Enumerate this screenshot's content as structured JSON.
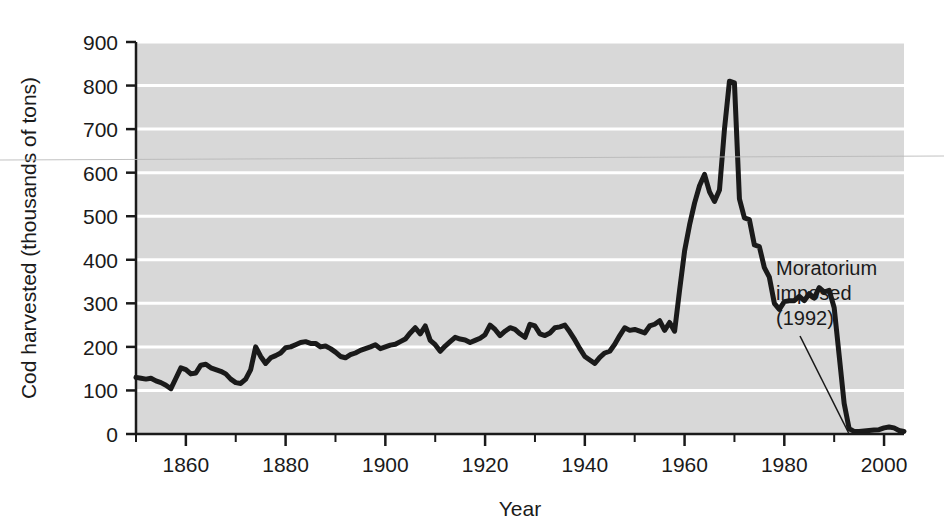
{
  "chart_data": {
    "type": "line",
    "title": "",
    "subtitle": "",
    "xlabel": "Year",
    "ylabel": "Cod harvested (thousands of tons)",
    "xlim": [
      1850,
      2004
    ],
    "ylim": [
      0,
      900
    ],
    "y_ticks": [
      0,
      100,
      200,
      300,
      400,
      500,
      600,
      700,
      800,
      900
    ],
    "y_tick_labels": [
      "0",
      "100",
      "200",
      "300",
      "400",
      "500",
      "600",
      "700",
      "800",
      "900"
    ],
    "x_ticks": [
      1860,
      1880,
      1900,
      1920,
      1940,
      1960,
      1980,
      2000
    ],
    "x_tick_labels": [
      "1860",
      "1880",
      "1900",
      "1920",
      "1940",
      "1960",
      "1980",
      "2000"
    ],
    "x_minor_ticks": [
      1850,
      1870,
      1890,
      1910,
      1930,
      1950,
      1970,
      1990
    ],
    "grid": "horizontal-white",
    "legend": "none",
    "plot_background": "#d8d8d8",
    "gridline_color": "#ffffff",
    "line_color": "#1a1a1a",
    "line_width_px": 5,
    "annotations": [
      {
        "name": "moratorium-annotation",
        "lines": [
          "Moratorium",
          "imposed",
          "(1992)"
        ],
        "points_to_year": 1993,
        "points_to_value": 0
      }
    ],
    "x": [
      1850,
      1851,
      1852,
      1853,
      1854,
      1855,
      1856,
      1857,
      1858,
      1859,
      1860,
      1861,
      1862,
      1863,
      1864,
      1865,
      1866,
      1867,
      1868,
      1869,
      1870,
      1871,
      1872,
      1873,
      1874,
      1875,
      1876,
      1877,
      1878,
      1879,
      1880,
      1881,
      1882,
      1883,
      1884,
      1885,
      1886,
      1887,
      1888,
      1889,
      1890,
      1891,
      1892,
      1893,
      1894,
      1895,
      1896,
      1897,
      1898,
      1899,
      1900,
      1901,
      1902,
      1903,
      1904,
      1905,
      1906,
      1907,
      1908,
      1909,
      1910,
      1911,
      1912,
      1913,
      1914,
      1915,
      1916,
      1917,
      1918,
      1919,
      1920,
      1921,
      1922,
      1923,
      1924,
      1925,
      1926,
      1927,
      1928,
      1929,
      1930,
      1931,
      1932,
      1933,
      1934,
      1935,
      1936,
      1937,
      1938,
      1939,
      1940,
      1941,
      1942,
      1943,
      1944,
      1945,
      1946,
      1947,
      1948,
      1949,
      1950,
      1951,
      1952,
      1953,
      1954,
      1955,
      1956,
      1957,
      1958,
      1959,
      1960,
      1961,
      1962,
      1963,
      1964,
      1965,
      1966,
      1967,
      1968,
      1969,
      1970,
      1971,
      1972,
      1973,
      1974,
      1975,
      1976,
      1977,
      1978,
      1979,
      1980,
      1981,
      1982,
      1983,
      1984,
      1985,
      1986,
      1987,
      1988,
      1989,
      1990,
      1991,
      1992,
      1993,
      1994,
      1995,
      1996,
      1997,
      1998,
      1999,
      2000,
      2001,
      2002,
      2003,
      2004
    ],
    "values": [
      130,
      128,
      126,
      128,
      122,
      118,
      112,
      104,
      128,
      152,
      148,
      138,
      140,
      158,
      160,
      152,
      148,
      144,
      138,
      126,
      118,
      116,
      126,
      148,
      200,
      178,
      162,
      175,
      180,
      186,
      198,
      200,
      205,
      210,
      212,
      208,
      208,
      200,
      202,
      196,
      188,
      178,
      175,
      182,
      186,
      192,
      196,
      200,
      205,
      196,
      200,
      204,
      206,
      212,
      218,
      232,
      244,
      230,
      248,
      215,
      205,
      190,
      202,
      212,
      222,
      218,
      216,
      210,
      215,
      220,
      228,
      250,
      240,
      226,
      236,
      244,
      240,
      230,
      222,
      252,
      248,
      230,
      226,
      232,
      244,
      246,
      250,
      234,
      216,
      196,
      178,
      170,
      162,
      176,
      186,
      190,
      206,
      226,
      244,
      238,
      240,
      236,
      232,
      248,
      252,
      260,
      238,
      256,
      236,
      330,
      420,
      480,
      530,
      570,
      596,
      556,
      534,
      560,
      700,
      810,
      806,
      540,
      496,
      492,
      434,
      430,
      382,
      360,
      300,
      286,
      304,
      306,
      306,
      316,
      306,
      322,
      312,
      336,
      326,
      330,
      290,
      180,
      70,
      12,
      6,
      6,
      7,
      8,
      9,
      10,
      14,
      16,
      14,
      8,
      6
    ]
  }
}
